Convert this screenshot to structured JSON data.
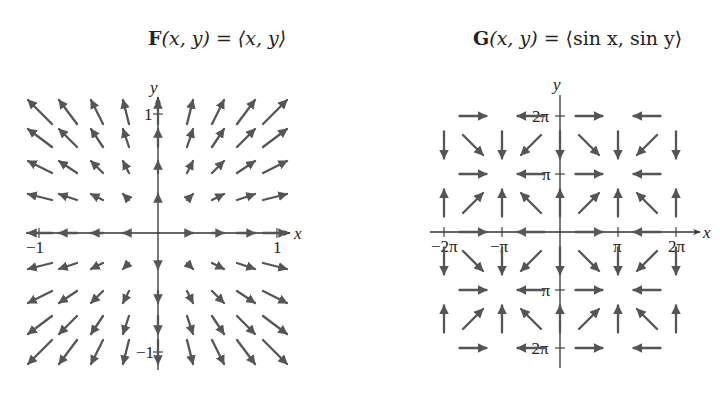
{
  "figure": {
    "left": {
      "title": {
        "bold": "F",
        "args": "(x, y)",
        "eq": " = ",
        "rhs": "⟨x, y⟩"
      },
      "axis_labels": {
        "x": "x",
        "y": "y"
      },
      "x_ticks": [
        {
          "label": "−1",
          "value": -1
        },
        {
          "label": "1",
          "value": 1
        }
      ],
      "y_ticks": [
        {
          "label": "1",
          "value": 1
        },
        {
          "label": "−1",
          "value": -1
        }
      ],
      "field": "<x, y>",
      "arrow_color": "#555555"
    },
    "right": {
      "title": {
        "bold": "G",
        "args": "(x, y)",
        "eq": " = ",
        "rhs": "⟨sin x, sin y⟩"
      },
      "axis_labels": {
        "x": "x",
        "y": "y"
      },
      "x_ticks": [
        {
          "label": "−2π",
          "value": -2
        },
        {
          "label": "−π",
          "value": -1
        },
        {
          "label": "π",
          "value": 1
        },
        {
          "label": "2π",
          "value": 2
        }
      ],
      "y_ticks": [
        {
          "label": "2π",
          "value": 2
        },
        {
          "label": "π",
          "value": 1
        },
        {
          "label": "−π",
          "value": -1
        },
        {
          "label": "−2π",
          "value": -2
        }
      ],
      "field": "<sin x, sin y>",
      "arrow_color": "#555555"
    }
  },
  "chart_data": [
    {
      "type": "vector_field",
      "title": "F(x, y) = ⟨x, y⟩",
      "xlabel": "x",
      "ylabel": "y",
      "xlim": [
        -1.1,
        1.1
      ],
      "ylim": [
        -1.1,
        1.1
      ],
      "grid_x": [
        -1,
        -0.78,
        -0.56,
        -0.33,
        0,
        0.33,
        0.56,
        0.78,
        1
      ],
      "grid_y": [
        -1,
        -0.78,
        -0.56,
        -0.33,
        0,
        0.33,
        0.56,
        0.78,
        1
      ],
      "tick_labels_x": [
        "−1",
        "1"
      ],
      "tick_labels_y": [
        "1",
        "−1"
      ]
    },
    {
      "type": "vector_field",
      "title": "G(x, y) = ⟨sin x, sin y⟩",
      "xlabel": "x",
      "ylabel": "y",
      "xlim": [
        -2.2,
        2.2
      ],
      "ylim": [
        -2.2,
        2.2
      ],
      "units": "multiples of π",
      "grid_step": "π/2",
      "tick_labels_x": [
        "−2π",
        "−π",
        "π",
        "2π"
      ],
      "tick_labels_y": [
        "2π",
        "π",
        "−π",
        "−2π"
      ]
    }
  ]
}
